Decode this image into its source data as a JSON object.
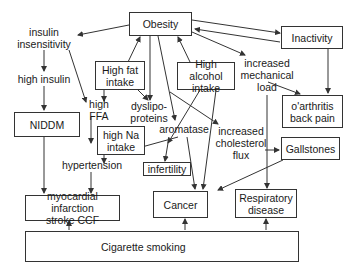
{
  "diagram": {
    "nodes": {
      "obesity": "Obesity",
      "inactivity": "Inactivity",
      "insulin_insensitivity": "insulin\ninsensitivity",
      "high_insulin": "high insulin",
      "niddm": "NIDDM",
      "high_fat_intake": "High fat\nintake",
      "high_ffa": "high FFA",
      "dyslipoproteins": "dyslipo-\nproteins",
      "high_alcohol_intake": "High alcohol\nintake",
      "increased_mechanical_load": "increased\nmechanical\nload",
      "oarthritis": "o'arthritis\nback pain",
      "high_na_intake": "high Na\nintake",
      "aromatase": "aromatase",
      "increased_cholesterol_flux": "increased\ncholesterol\nflux",
      "gallstones": "Gallstones",
      "hypertension": "hypertension",
      "infertility": "infertility",
      "myocardial": "myocardial infarction\nstroke    CCF",
      "cancer": "Cancer",
      "respiratory": "Respiratory\ndisease",
      "cigarette_smoking": "Cigarette smoking"
    },
    "colors": {
      "line": "#333333",
      "background": "#ffffff",
      "text": "#1a1a1a"
    }
  }
}
